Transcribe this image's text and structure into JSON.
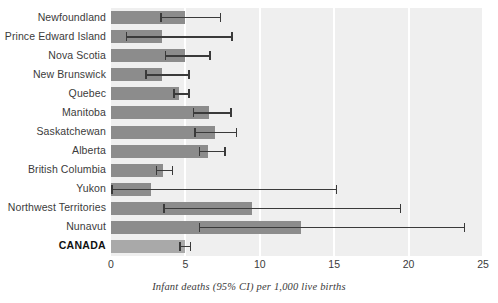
{
  "chart_data": {
    "type": "bar",
    "orientation": "horizontal",
    "title": "",
    "subtitle": "",
    "xlabel": "Infant deaths (95% CI) per 1,000 live births",
    "ylabel": "",
    "xlim": [
      0,
      25
    ],
    "xticks": [
      0,
      5,
      10,
      15,
      20,
      25
    ],
    "xtick_labels": [
      "0",
      "5",
      "10",
      "15",
      "20",
      "25"
    ],
    "grid": "vertical-white-on-light-gray",
    "legend": "none",
    "categories": [
      "Newfoundland",
      "Prince Edward Island",
      "Nova Scotia",
      "New Brunswick",
      "Quebec",
      "Manitoba",
      "Saskatchewan",
      "Alberta",
      "British Columbia",
      "Yukon",
      "Northwest Territories",
      "Nunavut",
      "CANADA"
    ],
    "series": [
      {
        "name": "Infant mortality rate",
        "values": [
          5.0,
          3.4,
          5.0,
          3.4,
          4.6,
          6.6,
          7.0,
          6.5,
          3.5,
          2.7,
          9.5,
          12.8,
          5.0
        ]
      }
    ],
    "ci_low": [
      3.3,
      1.0,
      3.6,
      2.3,
      4.2,
      5.5,
      5.6,
      5.9,
      3.0,
      0.0,
      3.5,
      5.9,
      4.6
    ],
    "ci_high": [
      7.4,
      8.2,
      6.7,
      5.3,
      5.3,
      8.1,
      8.5,
      7.7,
      4.2,
      15.2,
      19.5,
      23.8,
      5.4
    ],
    "highlight_category": "CANADA",
    "colors": {
      "bar": "#8c8c8c",
      "bar_highlight": "#a9a9a9",
      "plot_background": "#efefef",
      "gridline": "#ffffff",
      "error_bar": "#3a3a3a",
      "label_text": "#3b3b3b",
      "page_background": "#ffffff"
    }
  }
}
